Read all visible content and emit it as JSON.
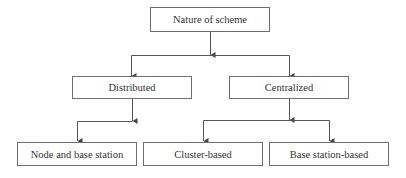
{
  "diagram": {
    "type": "tree",
    "colors": {
      "line": "#555555",
      "border": "#6e6e6e",
      "text": "#333333"
    },
    "nodes": {
      "root": {
        "label": "Nature of scheme"
      },
      "distributed": {
        "label": "Distributed"
      },
      "centralized": {
        "label": "Centralized"
      },
      "node_and_base_station": {
        "label": "Node and base station"
      },
      "cluster_based": {
        "label": "Cluster-based"
      },
      "base_station_based": {
        "label": "Base station-based"
      }
    },
    "edges": [
      {
        "from": "Nature of scheme",
        "to": "Distributed"
      },
      {
        "from": "Nature of scheme",
        "to": "Centralized"
      },
      {
        "from": "Distributed",
        "to": "Node and base station"
      },
      {
        "from": "Centralized",
        "to": "Cluster-based"
      },
      {
        "from": "Centralized",
        "to": "Base station-based"
      }
    ]
  }
}
